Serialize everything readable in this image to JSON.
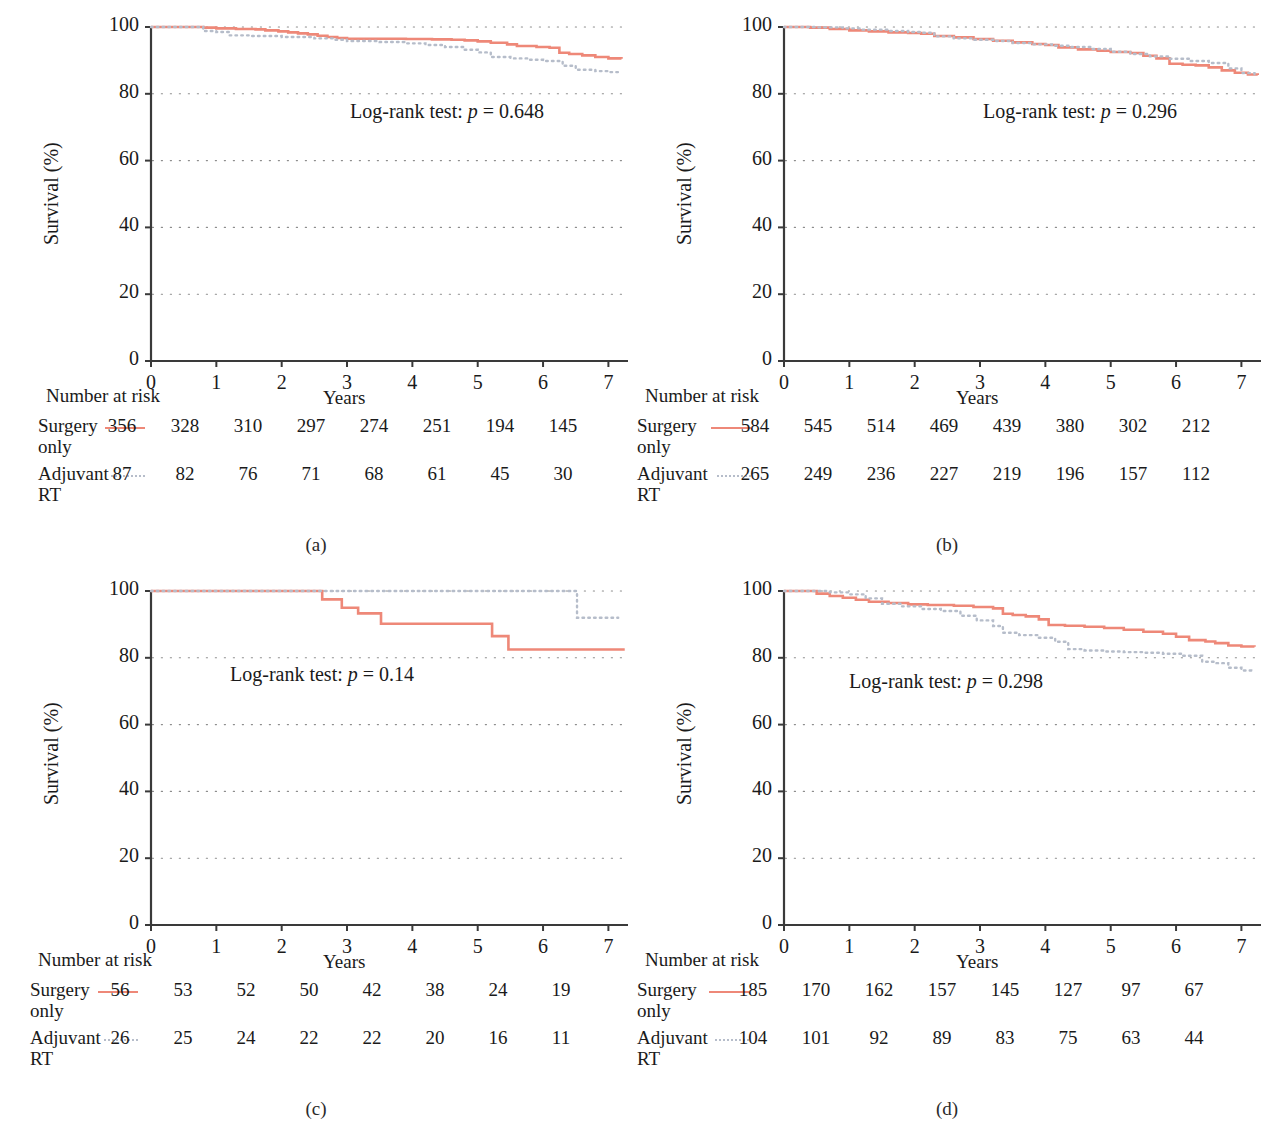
{
  "figure": {
    "panels": [
      "a",
      "b",
      "c",
      "d"
    ],
    "panel_label_format": "(x)"
  },
  "common": {
    "y_axis_label": "Survival (%)",
    "x_axis_label": "Years",
    "y_ticks": [
      "0",
      "20",
      "40",
      "60",
      "80",
      "100"
    ],
    "x_ticks": [
      "0",
      "1",
      "2",
      "3",
      "4",
      "5",
      "6",
      "7"
    ],
    "risk_title": "Number at risk",
    "group_surgery": "Surgery\nonly",
    "group_surgery_line1": "Surgery",
    "group_surgery_line2": "only",
    "group_adjuvant_line1": "Adjuvant",
    "group_adjuvant_line2": "RT",
    "logrank_prefix": "Log-rank test: ",
    "p_symbol": "p",
    "equals": " = ",
    "color_surgery": "#ee8878",
    "color_adjuvant": "#b6bdca",
    "color_axis": "#3a3a3a",
    "color_grid": "#8e8e8e"
  },
  "panels": {
    "a": {
      "label": "(a)",
      "p_value": "0.648",
      "risk": {
        "surgery": [
          "356",
          "328",
          "310",
          "297",
          "274",
          "251",
          "194",
          "145"
        ],
        "adjuvant": [
          "87",
          "82",
          "76",
          "71",
          "68",
          "61",
          "45",
          "30"
        ]
      }
    },
    "b": {
      "label": "(b)",
      "p_value": "0.296",
      "risk": {
        "surgery": [
          "584",
          "545",
          "514",
          "469",
          "439",
          "380",
          "302",
          "212"
        ],
        "adjuvant": [
          "265",
          "249",
          "236",
          "227",
          "219",
          "196",
          "157",
          "112"
        ]
      }
    },
    "c": {
      "label": "(c)",
      "p_value": "0.14",
      "risk": {
        "surgery": [
          "56",
          "53",
          "52",
          "50",
          "42",
          "38",
          "24",
          "19"
        ],
        "adjuvant": [
          "26",
          "25",
          "24",
          "22",
          "22",
          "20",
          "16",
          "11"
        ]
      }
    },
    "d": {
      "label": "(d)",
      "p_value": "0.298",
      "risk": {
        "surgery": [
          "185",
          "170",
          "162",
          "157",
          "145",
          "127",
          "97",
          "67"
        ],
        "adjuvant": [
          "104",
          "101",
          "92",
          "89",
          "83",
          "75",
          "63",
          "44"
        ]
      }
    }
  },
  "chart_data": [
    {
      "panel": "a",
      "type": "line",
      "subtype": "kaplan-meier-step",
      "title": "",
      "xlabel": "Years",
      "ylabel": "Survival (%)",
      "xlim": [
        0,
        7.3
      ],
      "ylim": [
        0,
        100
      ],
      "xticks": [
        0,
        1,
        2,
        3,
        4,
        5,
        6,
        7
      ],
      "yticks": [
        0,
        20,
        40,
        60,
        80,
        100
      ],
      "grid": "horizontal-dotted",
      "legend": "inline-risk-table",
      "annotation": "Log-rank test: p = 0.648",
      "series": [
        {
          "name": "Surgery only",
          "style": "solid",
          "color": "#ee8878",
          "x": [
            0,
            0.55,
            0.8,
            1.0,
            1.3,
            1.6,
            1.75,
            1.95,
            2.1,
            2.25,
            2.4,
            2.55,
            2.7,
            2.85,
            3.0,
            3.6,
            3.9,
            4.3,
            4.6,
            4.8,
            5.0,
            5.2,
            5.45,
            5.6,
            5.9,
            6.1,
            6.25,
            6.4,
            6.6,
            6.8,
            7.0,
            7.2
          ],
          "y": [
            100,
            100,
            99.8,
            99.6,
            99.4,
            99.3,
            99.0,
            98.7,
            98.4,
            98.1,
            97.8,
            97.4,
            97.0,
            96.7,
            96.5,
            96.5,
            96.4,
            96.3,
            96.2,
            96.0,
            95.7,
            95.3,
            94.8,
            94.3,
            94.0,
            93.8,
            92.3,
            91.9,
            91.5,
            91.0,
            90.6,
            90.5
          ]
        },
        {
          "name": "Adjuvant RT",
          "style": "dotted",
          "color": "#b6bdca",
          "x": [
            0,
            0.6,
            0.8,
            1.0,
            1.2,
            1.5,
            2.0,
            2.5,
            2.8,
            3.0,
            3.5,
            3.9,
            4.2,
            4.5,
            4.8,
            5.0,
            5.2,
            5.5,
            5.8,
            6.0,
            6.3,
            6.5,
            6.8,
            7.0,
            7.2
          ],
          "y": [
            100,
            100,
            98.8,
            98.5,
            97.5,
            97.3,
            97.0,
            96.6,
            96.2,
            95.8,
            95.5,
            95.1,
            94.6,
            94.0,
            93.2,
            92.4,
            91.0,
            90.6,
            90.2,
            89.8,
            88.4,
            87.2,
            86.8,
            86.5,
            86.4
          ]
        }
      ]
    },
    {
      "panel": "b",
      "type": "line",
      "subtype": "kaplan-meier-step",
      "title": "",
      "xlabel": "Years",
      "ylabel": "Survival (%)",
      "xlim": [
        0,
        7.3
      ],
      "ylim": [
        0,
        100
      ],
      "xticks": [
        0,
        1,
        2,
        3,
        4,
        5,
        6,
        7
      ],
      "yticks": [
        0,
        20,
        40,
        60,
        80,
        100
      ],
      "grid": "horizontal-dotted",
      "legend": "inline-risk-table",
      "annotation": "Log-rank test: p = 0.296",
      "series": [
        {
          "name": "Surgery only",
          "style": "solid",
          "color": "#ee8878",
          "x": [
            0,
            0.4,
            0.7,
            1.0,
            1.3,
            1.6,
            1.9,
            2.1,
            2.3,
            2.6,
            2.9,
            3.2,
            3.5,
            3.8,
            4.0,
            4.2,
            4.5,
            4.8,
            5.0,
            5.3,
            5.5,
            5.7,
            5.9,
            6.1,
            6.3,
            6.5,
            6.7,
            6.9,
            7.1,
            7.25
          ],
          "y": [
            100,
            99.8,
            99.4,
            99.0,
            98.7,
            98.4,
            98.2,
            98.0,
            97.3,
            96.9,
            96.4,
            95.9,
            95.4,
            94.9,
            94.6,
            93.9,
            93.3,
            92.9,
            92.5,
            92.2,
            91.4,
            90.6,
            89.0,
            88.7,
            88.5,
            87.9,
            87.0,
            86.3,
            85.8,
            85.6
          ]
        },
        {
          "name": "Adjuvant RT",
          "style": "dotted",
          "color": "#b6bdca",
          "x": [
            0,
            0.5,
            0.9,
            1.2,
            1.6,
            1.9,
            2.1,
            2.3,
            2.6,
            2.9,
            3.2,
            3.5,
            3.8,
            4.1,
            4.4,
            4.7,
            5.0,
            5.3,
            5.6,
            5.9,
            6.2,
            6.5,
            6.8,
            7.0,
            7.2
          ],
          "y": [
            100,
            99.9,
            99.6,
            99.2,
            98.8,
            98.5,
            98.3,
            97.2,
            96.6,
            96.2,
            95.8,
            95.2,
            94.8,
            94.4,
            94.0,
            93.4,
            92.6,
            91.9,
            91.2,
            90.5,
            89.8,
            89.2,
            87.6,
            86.2,
            85.7
          ]
        }
      ]
    },
    {
      "panel": "c",
      "type": "line",
      "subtype": "kaplan-meier-step",
      "title": "",
      "xlabel": "Years",
      "ylabel": "Survival (%)",
      "xlim": [
        0,
        7.3
      ],
      "ylim": [
        0,
        100
      ],
      "xticks": [
        0,
        1,
        2,
        3,
        4,
        5,
        6,
        7
      ],
      "yticks": [
        0,
        20,
        40,
        60,
        80,
        100
      ],
      "grid": "horizontal-dotted",
      "legend": "inline-risk-table",
      "annotation": "Log-rank test: p = 0.14",
      "series": [
        {
          "name": "Surgery only",
          "style": "solid",
          "color": "#ee8878",
          "x": [
            0,
            2.6,
            2.62,
            2.9,
            2.92,
            3.15,
            3.17,
            3.5,
            3.52,
            5.2,
            5.22,
            5.45,
            5.47,
            7.25
          ],
          "y": [
            100,
            100,
            97.5,
            97.5,
            95.0,
            95.0,
            93.3,
            93.3,
            90.2,
            90.2,
            86.5,
            86.5,
            82.5,
            82.5
          ]
        },
        {
          "name": "Adjuvant RT",
          "style": "dotted",
          "color": "#b6bdca",
          "x": [
            0,
            6.5,
            6.52,
            7.15
          ],
          "y": [
            100,
            100,
            92.0,
            92.0
          ]
        }
      ]
    },
    {
      "panel": "d",
      "type": "line",
      "subtype": "kaplan-meier-step",
      "title": "",
      "xlabel": "Years",
      "ylabel": "Survival (%)",
      "xlim": [
        0,
        7.3
      ],
      "ylim": [
        0,
        100
      ],
      "xticks": [
        0,
        1,
        2,
        3,
        4,
        5,
        6,
        7
      ],
      "yticks": [
        0,
        20,
        40,
        60,
        80,
        100
      ],
      "grid": "horizontal-dotted",
      "legend": "inline-risk-table",
      "annotation": "Log-rank test: p = 0.298",
      "series": [
        {
          "name": "Surgery only",
          "style": "solid",
          "color": "#ee8878",
          "x": [
            0,
            0.35,
            0.5,
            0.7,
            0.9,
            1.1,
            1.3,
            1.6,
            1.9,
            2.2,
            2.6,
            2.9,
            3.2,
            3.35,
            3.5,
            3.7,
            3.9,
            4.05,
            4.3,
            4.6,
            4.9,
            5.2,
            5.5,
            5.8,
            6.0,
            6.2,
            6.45,
            6.6,
            6.8,
            7.0,
            7.2
          ],
          "y": [
            100,
            100,
            99.2,
            98.5,
            98.0,
            97.4,
            96.8,
            96.4,
            96.0,
            95.8,
            95.6,
            95.2,
            94.8,
            93.2,
            92.8,
            92.4,
            91.5,
            89.8,
            89.6,
            89.3,
            88.9,
            88.4,
            87.8,
            87.2,
            86.3,
            85.3,
            84.9,
            84.4,
            83.7,
            83.4,
            83.3
          ]
        },
        {
          "name": "Adjuvant RT",
          "style": "dotted",
          "color": "#b6bdca",
          "x": [
            0,
            0.4,
            0.7,
            1.0,
            1.25,
            1.5,
            1.8,
            2.1,
            2.4,
            2.7,
            2.95,
            3.2,
            3.35,
            3.6,
            3.9,
            4.15,
            4.35,
            4.6,
            4.9,
            5.2,
            5.5,
            5.8,
            6.1,
            6.4,
            6.6,
            6.8,
            7.0,
            7.15
          ],
          "y": [
            100,
            100,
            99.6,
            99.0,
            97.8,
            96.2,
            95.4,
            94.6,
            94.0,
            92.6,
            91.2,
            89.5,
            87.5,
            86.8,
            86.0,
            84.8,
            82.6,
            82.2,
            81.9,
            81.7,
            81.5,
            81.2,
            80.6,
            78.8,
            78.4,
            77.0,
            76.2,
            76.1
          ]
        }
      ]
    }
  ]
}
